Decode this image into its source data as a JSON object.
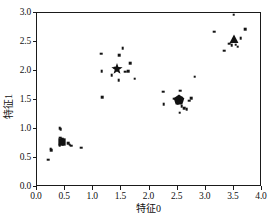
{
  "chart_data": {
    "type": "scatter",
    "title": "",
    "xlabel": "特征0",
    "ylabel": "特征1",
    "xlim": [
      0.0,
      4.0
    ],
    "ylim": [
      0.0,
      3.0
    ],
    "xticks": [
      "0.0",
      "0.5",
      "1.0",
      "1.5",
      "2.0",
      "2.5",
      "3.0",
      "3.5",
      "4.0"
    ],
    "xtick_values": [
      0.0,
      0.5,
      1.0,
      1.5,
      2.0,
      2.5,
      3.0,
      3.5,
      4.0
    ],
    "yticks": [
      "0.0",
      "0.5",
      "1.0",
      "1.5",
      "2.0",
      "2.5",
      "3.0"
    ],
    "ytick_values": [
      0.0,
      0.5,
      1.0,
      1.5,
      2.0,
      2.5,
      3.0
    ],
    "grid": false,
    "legend": null,
    "marker_color": "#141414",
    "point_marker": "square",
    "series": [
      {
        "name": "cluster-0",
        "centroid_marker": "square",
        "centroid": [
          0.44,
          0.78
        ],
        "points": [
          [
            0.2,
            0.47
          ],
          [
            0.24,
            0.66
          ],
          [
            0.25,
            0.63
          ],
          [
            0.4,
            1.01
          ],
          [
            0.42,
            1.0
          ],
          [
            0.41,
            0.85
          ],
          [
            0.45,
            0.83
          ],
          [
            0.43,
            0.76
          ],
          [
            0.47,
            0.79
          ],
          [
            0.4,
            0.72
          ],
          [
            0.46,
            0.73
          ],
          [
            0.55,
            0.76
          ],
          [
            0.58,
            0.73
          ],
          [
            0.61,
            0.71
          ],
          [
            0.79,
            0.68
          ]
        ]
      },
      {
        "name": "cluster-1",
        "centroid_marker": "star",
        "centroid": [
          1.43,
          2.03
        ],
        "points": [
          [
            1.14,
            2.3
          ],
          [
            1.15,
            2.0
          ],
          [
            1.16,
            1.55
          ],
          [
            1.33,
            1.93
          ],
          [
            1.39,
            2.06
          ],
          [
            1.46,
            2.27
          ],
          [
            1.45,
            1.84
          ],
          [
            1.52,
            2.39
          ],
          [
            1.57,
            1.99
          ],
          [
            1.62,
            2.0
          ],
          [
            1.66,
            2.13
          ],
          [
            1.74,
            1.87
          ]
        ]
      },
      {
        "name": "cluster-2",
        "centroid_marker": "pentagon",
        "centroid": [
          2.53,
          1.5
        ],
        "points": [
          [
            2.24,
            1.64
          ],
          [
            2.25,
            1.43
          ],
          [
            2.44,
            1.52
          ],
          [
            2.48,
            1.5
          ],
          [
            2.52,
            1.49
          ],
          [
            2.5,
            1.44
          ],
          [
            2.56,
            1.53
          ],
          [
            2.55,
            1.66
          ],
          [
            2.57,
            1.39
          ],
          [
            2.54,
            1.28
          ],
          [
            2.62,
            1.36
          ],
          [
            2.66,
            1.34
          ],
          [
            2.71,
            1.49
          ],
          [
            2.74,
            1.53
          ],
          [
            2.8,
            1.9
          ]
        ]
      },
      {
        "name": "cluster-3",
        "centroid_marker": "triangle",
        "centroid": [
          3.5,
          2.55
        ],
        "points": [
          [
            3.15,
            2.68
          ],
          [
            3.33,
            2.35
          ],
          [
            3.42,
            2.47
          ],
          [
            3.46,
            2.44
          ],
          [
            3.5,
            2.97
          ],
          [
            3.53,
            2.45
          ],
          [
            3.57,
            2.42
          ],
          [
            3.62,
            2.57
          ],
          [
            3.7,
            2.72
          ]
        ]
      }
    ]
  }
}
